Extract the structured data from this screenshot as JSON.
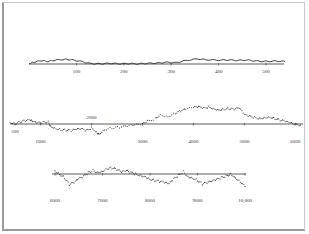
{
  "chart_data": {
    "type": "scatter",
    "title": "",
    "xlabel": "",
    "ylabel": "",
    "grid": false,
    "legend": null,
    "panels": [
      {
        "name": "row-1",
        "x_range": [
          0,
          540
        ],
        "tick_labels": [
          "100",
          "200",
          "300",
          "400",
          "500"
        ],
        "tick_values": [
          100,
          200,
          300,
          400,
          500
        ],
        "points": [
          [
            0,
            0.5
          ],
          [
            10,
            2
          ],
          [
            25,
            4
          ],
          [
            40,
            3
          ],
          [
            55,
            4.5
          ],
          [
            75,
            5.5
          ],
          [
            90,
            5
          ],
          [
            110,
            3
          ],
          [
            130,
            0.5
          ],
          [
            150,
            0.2
          ],
          [
            170,
            0.8
          ],
          [
            190,
            0.3
          ],
          [
            210,
            0.5
          ],
          [
            230,
            0.2
          ],
          [
            250,
            0.8
          ],
          [
            270,
            1
          ],
          [
            290,
            2
          ],
          [
            310,
            1.5
          ],
          [
            330,
            4
          ],
          [
            355,
            6
          ],
          [
            375,
            5
          ],
          [
            400,
            4.5
          ],
          [
            420,
            4.8
          ],
          [
            440,
            4.2
          ],
          [
            460,
            4.6
          ],
          [
            480,
            3.5
          ],
          [
            500,
            3
          ],
          [
            520,
            3.4
          ],
          [
            540,
            3
          ]
        ]
      },
      {
        "name": "row-2",
        "x_range": [
          400,
          6150
        ],
        "tick_labels": [
          "500",
          "1000",
          "2000",
          "3000",
          "4000",
          "5000",
          "6000"
        ],
        "tick_values": [
          500,
          1000,
          2000,
          3000,
          4000,
          5000,
          6000
        ],
        "points": [
          [
            400,
            3
          ],
          [
            500,
            1
          ],
          [
            600,
            4
          ],
          [
            700,
            6
          ],
          [
            800,
            7
          ],
          [
            850,
            4
          ],
          [
            950,
            2
          ],
          [
            1050,
            3
          ],
          [
            1150,
            4
          ],
          [
            1200,
            -4
          ],
          [
            1300,
            -8
          ],
          [
            1400,
            -10
          ],
          [
            1500,
            -11
          ],
          [
            1600,
            -12
          ],
          [
            1700,
            -10
          ],
          [
            1800,
            -9
          ],
          [
            1900,
            -12
          ],
          [
            2000,
            -7
          ],
          [
            2100,
            -15
          ],
          [
            2150,
            -18
          ],
          [
            2250,
            -10
          ],
          [
            2400,
            -7
          ],
          [
            2550,
            -6
          ],
          [
            2700,
            -4
          ],
          [
            2850,
            -2
          ],
          [
            3000,
            0
          ],
          [
            3100,
            5
          ],
          [
            3250,
            10
          ],
          [
            3350,
            17
          ],
          [
            3500,
            14
          ],
          [
            3650,
            20
          ],
          [
            3750,
            24
          ],
          [
            3850,
            27
          ],
          [
            4000,
            30
          ],
          [
            4100,
            31
          ],
          [
            4200,
            29
          ],
          [
            4300,
            31
          ],
          [
            4400,
            28
          ],
          [
            4500,
            26
          ],
          [
            4600,
            27
          ],
          [
            4700,
            28
          ],
          [
            4800,
            27
          ],
          [
            4900,
            29
          ],
          [
            5000,
            17
          ],
          [
            5100,
            14
          ],
          [
            5200,
            12
          ],
          [
            5300,
            10
          ],
          [
            5400,
            12
          ],
          [
            5500,
            13
          ],
          [
            5600,
            10
          ],
          [
            5700,
            7
          ],
          [
            5800,
            5
          ],
          [
            5900,
            2
          ],
          [
            6000,
            -1
          ],
          [
            6100,
            -2
          ]
        ]
      },
      {
        "name": "row-3",
        "x_range": [
          6000,
          10000
        ],
        "tick_labels": [
          "6000",
          "7000",
          "8000",
          "9000",
          "10,000"
        ],
        "tick_values": [
          6000,
          7000,
          8000,
          9000,
          10000
        ],
        "points": [
          [
            6000,
            5
          ],
          [
            6100,
            0
          ],
          [
            6200,
            -6
          ],
          [
            6300,
            -17
          ],
          [
            6400,
            -14
          ],
          [
            6500,
            -8
          ],
          [
            6600,
            -4
          ],
          [
            6700,
            2
          ],
          [
            6800,
            6
          ],
          [
            6900,
            3
          ],
          [
            7000,
            5
          ],
          [
            7100,
            9
          ],
          [
            7200,
            10
          ],
          [
            7300,
            7
          ],
          [
            7400,
            3
          ],
          [
            7500,
            5
          ],
          [
            7600,
            2
          ],
          [
            7700,
            0
          ],
          [
            7800,
            -2
          ],
          [
            7900,
            -4
          ],
          [
            8000,
            -8
          ],
          [
            8100,
            -10
          ],
          [
            8200,
            -12
          ],
          [
            8300,
            -14
          ],
          [
            8400,
            -16
          ],
          [
            8500,
            -8
          ],
          [
            8600,
            -2
          ],
          [
            8700,
            4
          ],
          [
            8800,
            -4
          ],
          [
            8900,
            -6
          ],
          [
            9000,
            -10
          ],
          [
            9100,
            -16
          ],
          [
            9200,
            -14
          ],
          [
            9300,
            -12
          ],
          [
            9400,
            -9
          ],
          [
            9500,
            -6
          ],
          [
            9600,
            -3
          ],
          [
            9700,
            0
          ],
          [
            9800,
            -6
          ],
          [
            9900,
            -12
          ],
          [
            10000,
            -20
          ]
        ]
      }
    ]
  },
  "figure": {
    "background": "#ffffff",
    "frame_color": "#9a9a9a",
    "series_color": "#2a2a2a",
    "axis_color": "#333333"
  }
}
